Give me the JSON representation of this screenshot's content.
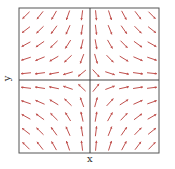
{
  "chart_data": {
    "type": "quiver",
    "title": "",
    "xlabel": "x",
    "ylabel": "y",
    "grid": false,
    "xlim": [
      -1,
      1
    ],
    "ylim": [
      -1,
      1
    ],
    "nx": 10,
    "ny": 10,
    "field": {
      "u": "x",
      "v": "-y"
    },
    "arrow_color": "#c0504d",
    "axis_color": "#444444",
    "frame_color": "#555555"
  },
  "labels": {
    "x": "x",
    "y": "y"
  }
}
